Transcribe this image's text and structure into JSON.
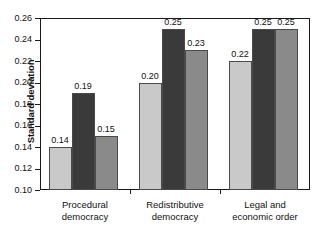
{
  "chart_data": {
    "type": "bar",
    "title": "",
    "subtitle": "",
    "xlabel": "",
    "ylabel": "Standard deviation",
    "ylim": [
      0.1,
      0.26
    ],
    "yticks": [
      "0.10",
      "0.12",
      "0.14",
      "0.16",
      "0.18",
      "0.20",
      "0.22",
      "0.24",
      "0.26"
    ],
    "ytick_values": [
      0.1,
      0.12,
      0.14,
      0.16,
      0.18,
      0.2,
      0.22,
      0.24,
      0.26
    ],
    "grid": false,
    "legend": "none",
    "categories": [
      "Procedural democracy",
      "Redistributive democracy",
      "Legal and economic order"
    ],
    "category_lines": [
      [
        "Procedural",
        "democracy"
      ],
      [
        "Redistributive",
        "democracy"
      ],
      [
        "Legal and",
        "economic order"
      ]
    ],
    "series": [
      {
        "name": "series-1",
        "color": "#c9c9c9",
        "values": [
          0.14,
          0.2,
          0.22
        ],
        "labels": [
          "0.14",
          "0.20",
          "0.22"
        ]
      },
      {
        "name": "series-2",
        "color": "#3a3a3a",
        "values": [
          0.19,
          0.25,
          0.25
        ],
        "labels": [
          "0.19",
          "0.25",
          "0.25"
        ]
      },
      {
        "name": "series-3",
        "color": "#8a8a8a",
        "values": [
          0.15,
          0.23,
          0.25
        ],
        "labels": [
          "0.15",
          "0.23",
          "0.25"
        ]
      }
    ],
    "colors": {
      "series_1": "#c9c9c9",
      "series_2": "#3a3a3a",
      "series_3": "#8a8a8a",
      "axis": "#1a1a1a",
      "text": "#111111",
      "background": "#ffffff",
      "bar_outline": "#4a4a4a"
    }
  }
}
